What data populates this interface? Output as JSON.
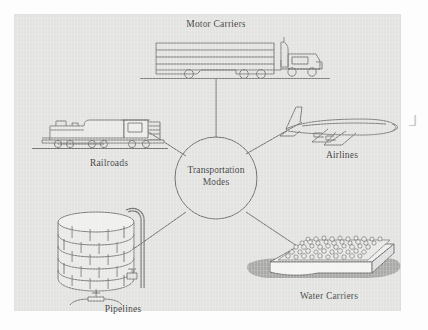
{
  "figure": {
    "type": "hub-and-spoke",
    "hub": {
      "line1": "Transportation",
      "line2": "Modes"
    },
    "nodes": [
      {
        "id": "motor-carriers",
        "label": "Motor Carriers",
        "icon": "semi-truck-icon",
        "position": "top"
      },
      {
        "id": "airlines",
        "label": "Airlines",
        "icon": "airplane-icon",
        "position": "right"
      },
      {
        "id": "water-carriers",
        "label": "Water Carriers",
        "icon": "barge-icon",
        "position": "bottom-right"
      },
      {
        "id": "pipelines",
        "label": "Pipelines",
        "icon": "storage-tank-icon",
        "position": "bottom-left"
      },
      {
        "id": "railroads",
        "label": "Railroads",
        "icon": "locomotive-icon",
        "position": "left"
      }
    ],
    "margin_annotation": "⅃"
  },
  "colors": {
    "panel_background": "#e3e3e1",
    "page_background": "#fdfdfd",
    "line": "#6e6e6e",
    "text": "#3d3d3d",
    "water_shadow": "#a9a9a7"
  }
}
